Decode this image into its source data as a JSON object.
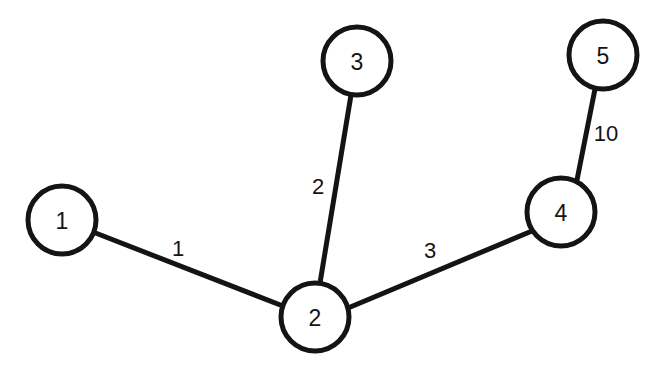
{
  "chart_data": {
    "type": "diagram",
    "title": "",
    "subtitle": "",
    "graph_kind": "undirected weighted graph",
    "background_color": "#ffffff",
    "stroke_color": "#141414",
    "node_fill_color": "#ffffff",
    "node_radius": 34,
    "stroke_width": 5,
    "canvas": {
      "width": 657,
      "height": 376
    },
    "nodes": [
      {
        "id": "1",
        "label": "1",
        "cx": 62,
        "cy": 220
      },
      {
        "id": "2",
        "label": "2",
        "cx": 315,
        "cy": 317
      },
      {
        "id": "3",
        "label": "3",
        "cx": 357,
        "cy": 61
      },
      {
        "id": "4",
        "label": "4",
        "cx": 561,
        "cy": 212
      },
      {
        "id": "5",
        "label": "5",
        "cx": 603,
        "cy": 55
      }
    ],
    "edges": [
      {
        "source": "1",
        "target": "2",
        "weight": 1,
        "weight_label": "1",
        "x1": 93,
        "y1": 232,
        "x2": 288,
        "y2": 308,
        "label_x": 178,
        "label_y": 248
      },
      {
        "source": "3",
        "target": "2",
        "weight": 2,
        "weight_label": "2",
        "x1": 351,
        "y1": 95,
        "x2": 320,
        "y2": 283,
        "label_x": 318,
        "label_y": 186
      },
      {
        "source": "2",
        "target": "4",
        "weight": 3,
        "weight_label": "3",
        "x1": 348,
        "y1": 308,
        "x2": 532,
        "y2": 231,
        "label_x": 430,
        "label_y": 250
      },
      {
        "source": "5",
        "target": "4",
        "weight": 10,
        "weight_label": "10",
        "x1": 595,
        "y1": 89,
        "x2": 577,
        "y2": 180,
        "label_x": 606,
        "label_y": 133
      }
    ]
  }
}
